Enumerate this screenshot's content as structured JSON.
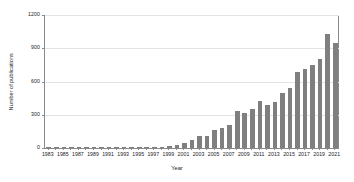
{
  "chart_data": {
    "type": "bar",
    "title": "",
    "xlabel": "Year",
    "ylabel": "Number of publications",
    "ylim": [
      0,
      1200
    ],
    "yticks": [
      0,
      300,
      600,
      900,
      1200
    ],
    "ytick_labels": [
      "0",
      "300",
      "600",
      "900",
      "1200"
    ],
    "grid": "horizontal",
    "legend": "none",
    "bar_color": "#7f7f7f",
    "axis_color": "#8a8a8a",
    "grid_color": "#e3e3e3",
    "xtick_labels": [
      "1983",
      "1985",
      "1987",
      "1989",
      "1991",
      "1993",
      "1995",
      "1997",
      "1999",
      "2001",
      "2003",
      "2005",
      "2007",
      "2009",
      "2011",
      "2013",
      "2015",
      "2017",
      "2019",
      "2021"
    ],
    "categories": [
      "1983",
      "1984",
      "1985",
      "1986",
      "1987",
      "1988",
      "1989",
      "1990",
      "1991",
      "1992",
      "1993",
      "1994",
      "1995",
      "1996",
      "1997",
      "1998",
      "1999",
      "2000",
      "2001",
      "2002",
      "2003",
      "2004",
      "2005",
      "2006",
      "2007",
      "2008",
      "2009",
      "2010",
      "2011",
      "2012",
      "2013",
      "2014",
      "2015",
      "2016",
      "2017",
      "2018",
      "2019",
      "2020",
      "2021"
    ],
    "values": [
      1,
      1,
      2,
      1,
      2,
      2,
      2,
      2,
      2,
      2,
      3,
      3,
      4,
      5,
      6,
      8,
      14,
      25,
      42,
      70,
      110,
      105,
      160,
      185,
      210,
      330,
      320,
      355,
      420,
      390,
      415,
      500,
      545,
      690,
      710,
      745,
      805,
      1030,
      950
    ]
  }
}
